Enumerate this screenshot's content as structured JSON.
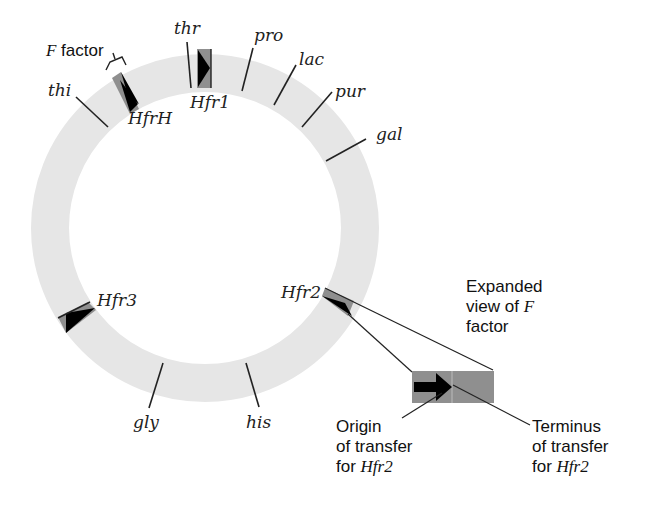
{
  "diagram": {
    "type": "circular chromosome map",
    "colors": {
      "ring": "#e6e6e6",
      "insert_gray": "#8f8f8f",
      "arrow": "#000000",
      "line": "#222222"
    },
    "genes": [
      {
        "label": "thr"
      },
      {
        "label": "pro"
      },
      {
        "label": "lac"
      },
      {
        "label": "pur"
      },
      {
        "label": "gal"
      },
      {
        "label": "his"
      },
      {
        "label": "gly"
      },
      {
        "label": "thi"
      }
    ],
    "hfr_strains": [
      {
        "label": "HfrH"
      },
      {
        "label": "Hfr1"
      },
      {
        "label": "Hfr2"
      },
      {
        "label": "Hfr3"
      }
    ],
    "f_factor_label": {
      "italic": "F",
      "rest": " factor"
    },
    "expanded_view": {
      "line1": "Expanded",
      "line2": "view of ",
      "line2_italic": "F",
      "line3": "factor"
    },
    "origin_label": {
      "line1": "Origin",
      "line2": "of transfer",
      "line3": "for ",
      "line3_italic": "Hfr2"
    },
    "terminus_label": {
      "line1": "Terminus",
      "line2": "of transfer",
      "line3": "for ",
      "line3_italic": "Hfr2"
    }
  }
}
